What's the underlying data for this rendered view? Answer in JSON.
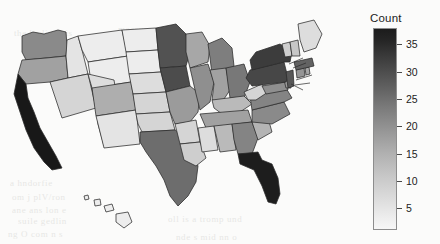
{
  "figure": {
    "type": "choropleth-map",
    "region": "United States",
    "background_color": "#fbfbfa",
    "state_border_color": "#2a2a2a"
  },
  "legend": {
    "title": "Count",
    "orientation": "vertical",
    "position": "right",
    "low_color": "#f7f7f7",
    "high_color": "#1c1c1c",
    "ticks": [
      {
        "value": "35",
        "v": 35
      },
      {
        "value": "30",
        "v": 30
      },
      {
        "value": "25",
        "v": 25
      },
      {
        "value": "20",
        "v": 20
      },
      {
        "value": "15",
        "v": 15
      },
      {
        "value": "10",
        "v": 10
      },
      {
        "value": "5",
        "v": 5
      }
    ],
    "range": [
      1,
      38
    ]
  },
  "ghost_text": [
    {
      "text": "the bodiesseis",
      "x": 14,
      "y": 28
    },
    {
      "text": "measurementic",
      "x": 118,
      "y": 24
    },
    {
      "text": "of the mostly prod",
      "x": 122,
      "y": 54
    },
    {
      "text": "sind gartie ulscare",
      "x": 96,
      "y": 90
    },
    {
      "text": "a  hndorfie",
      "x": 10,
      "y": 178
    },
    {
      "text": "om j plV/ron",
      "x": 12,
      "y": 192
    },
    {
      "text": "ane ans lon e",
      "x": 12,
      "y": 205
    },
    {
      "text": "suile  gedlin",
      "x": 18,
      "y": 216
    },
    {
      "text": "ng O com n s",
      "x": 8,
      "y": 229
    },
    {
      "text": "oll is  a  tromp und",
      "x": 168,
      "y": 214
    },
    {
      "text": "nde s  mid  nn o",
      "x": 176,
      "y": 232
    }
  ],
  "chart_data": {
    "type": "heatmap",
    "title": "",
    "xlabel": "",
    "ylabel": "",
    "legend_title": "Count",
    "colorscale": "grays-light-to-dark",
    "value_range": [
      1,
      38
    ],
    "tick_values": [
      5,
      10,
      15,
      20,
      25,
      30,
      35
    ],
    "states": [
      {
        "code": "WA",
        "name": "Washington",
        "value": 17
      },
      {
        "code": "OR",
        "name": "Oregon",
        "value": 13
      },
      {
        "code": "ID",
        "name": "Idaho",
        "value": 3
      },
      {
        "code": "MT",
        "name": "Montana",
        "value": 2
      },
      {
        "code": "WY",
        "name": "Wyoming",
        "value": 2
      },
      {
        "code": "CA",
        "name": "California",
        "value": 38
      },
      {
        "code": "NV",
        "name": "Nevada",
        "value": 5
      },
      {
        "code": "UT",
        "name": "Utah",
        "value": 4
      },
      {
        "code": "AZ",
        "name": "Arizona",
        "value": 6
      },
      {
        "code": "CO",
        "name": "Colorado",
        "value": 11
      },
      {
        "code": "NM",
        "name": "New Mexico",
        "value": 3
      },
      {
        "code": "ND",
        "name": "North Dakota",
        "value": 2
      },
      {
        "code": "SD",
        "name": "South Dakota",
        "value": 2
      },
      {
        "code": "NE",
        "name": "Nebraska",
        "value": 4
      },
      {
        "code": "KS",
        "name": "Kansas",
        "value": 5
      },
      {
        "code": "OK",
        "name": "Oklahoma",
        "value": 5
      },
      {
        "code": "TX",
        "name": "Texas",
        "value": 22
      },
      {
        "code": "MN",
        "name": "Minnesota",
        "value": 27
      },
      {
        "code": "IA",
        "name": "Iowa",
        "value": 28
      },
      {
        "code": "MO",
        "name": "Missouri",
        "value": 14
      },
      {
        "code": "AR",
        "name": "Arkansas",
        "value": 5
      },
      {
        "code": "LA",
        "name": "Louisiana",
        "value": 6
      },
      {
        "code": "WI",
        "name": "Wisconsin",
        "value": 12
      },
      {
        "code": "IL",
        "name": "Illinois",
        "value": 16
      },
      {
        "code": "MI",
        "name": "Michigan",
        "value": 19
      },
      {
        "code": "IN",
        "name": "Indiana",
        "value": 13
      },
      {
        "code": "OH",
        "name": "Ohio",
        "value": 20
      },
      {
        "code": "KY",
        "name": "Kentucky",
        "value": 9
      },
      {
        "code": "TN",
        "name": "Tennessee",
        "value": 13
      },
      {
        "code": "MS",
        "name": "Mississippi",
        "value": 4
      },
      {
        "code": "AL",
        "name": "Alabama",
        "value": 9
      },
      {
        "code": "GA",
        "name": "Georgia",
        "value": 18
      },
      {
        "code": "FL",
        "name": "Florida",
        "value": 37
      },
      {
        "code": "SC",
        "name": "South Carolina",
        "value": 10
      },
      {
        "code": "NC",
        "name": "North Carolina",
        "value": 17
      },
      {
        "code": "VA",
        "name": "Virginia",
        "value": 18
      },
      {
        "code": "WV",
        "name": "West Virginia",
        "value": 5
      },
      {
        "code": "MD",
        "name": "Maryland",
        "value": 16
      },
      {
        "code": "DE",
        "name": "Delaware",
        "value": 14
      },
      {
        "code": "PA",
        "name": "Pennsylvania",
        "value": 29
      },
      {
        "code": "NJ",
        "name": "New Jersey",
        "value": 26
      },
      {
        "code": "NY",
        "name": "New York",
        "value": 31
      },
      {
        "code": "CT",
        "name": "Connecticut",
        "value": 15
      },
      {
        "code": "RI",
        "name": "Rhode Island",
        "value": 12
      },
      {
        "code": "MA",
        "name": "Massachusetts",
        "value": 24
      },
      {
        "code": "VT",
        "name": "Vermont",
        "value": 6
      },
      {
        "code": "NH",
        "name": "New Hampshire",
        "value": 7
      },
      {
        "code": "ME",
        "name": "Maine",
        "value": 4
      },
      {
        "code": "HI",
        "name": "Hawaii",
        "value": 2
      }
    ]
  }
}
